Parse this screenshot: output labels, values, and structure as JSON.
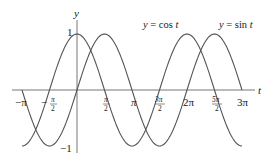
{
  "chart_data": {
    "type": "line",
    "title": "",
    "xlabel": "t",
    "ylabel": "y",
    "xlim": [
      -3.5,
      3.3
    ],
    "ylim": [
      -1.1,
      1.2
    ],
    "grid": false,
    "x_ticks": [
      {
        "value": -3.14159,
        "label": "−π"
      },
      {
        "value": -1.5708,
        "label": "−π/2"
      },
      {
        "value": 1.5708,
        "label": "π/2"
      },
      {
        "value": 3.14159,
        "label": "π"
      },
      {
        "value": 4.71239,
        "label": "3π/2"
      },
      {
        "value": 6.28319,
        "label": "2π"
      },
      {
        "value": 7.85398,
        "label": "5π/2"
      },
      {
        "value": 9.42478,
        "label": "3π"
      }
    ],
    "y_ticks": [
      {
        "value": 1,
        "label": "1"
      },
      {
        "value": -1,
        "label": "−1"
      }
    ],
    "series": [
      {
        "name": "y = cos t",
        "function": "cos",
        "t_range": [
          -3.14159,
          9.42478
        ]
      },
      {
        "name": "y = sin t",
        "function": "sin",
        "t_range": [
          -3.14159,
          9.42478
        ]
      }
    ],
    "annotations": [
      {
        "text": "y = cos t",
        "near_t": 4.5
      },
      {
        "text": "y = sin t",
        "near_t": 7.7
      }
    ]
  },
  "labels": {
    "y_axis": "y",
    "t_axis": "t",
    "one": "1",
    "neg_one": "−1",
    "cos_label_y": "y",
    "cos_label_rest": " = cos ",
    "cos_label_t": "t",
    "sin_label_y": "y",
    "sin_label_rest": " = sin ",
    "sin_label_t": "t",
    "tick_neg_pi": "−π",
    "tick_neg_half_minus": "−",
    "tick_pi_num": "π",
    "tick_2_den": "2",
    "tick_pi": "π",
    "tick_3pi_num": "3π",
    "tick_2pi": "2π",
    "tick_5pi_num": "5π",
    "tick_3pi": "3π"
  },
  "colors": {
    "curve": "#555555",
    "axis": "#777777"
  }
}
